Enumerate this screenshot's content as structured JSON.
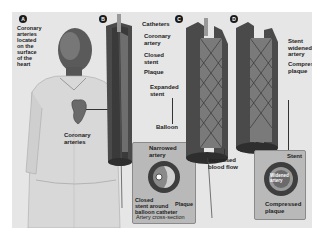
{
  "diagram": {
    "type": "medical-illustration",
    "panels": [
      {
        "id": "A",
        "labels": {
          "intro": "Coronary\narteries\nlocated\non the\nsurface\nof the\nheart",
          "heart": "Coronary\narteries"
        }
      },
      {
        "id": "B",
        "labels": {
          "catheters": "Catheters",
          "coronary_artery": "Coronary\nartery",
          "closed_stent": "Closed\nstent",
          "plaque": "Plaque",
          "expanded_stent": "Expanded\nstent",
          "balloon": "Balloon",
          "narrowed_artery": "Narrowed\nartery",
          "cross_closed_stent": "Closed\nstent around\nballoon catheter",
          "cross_plaque": "Plaque",
          "cross_caption": "Artery cross-section"
        }
      },
      {
        "id": "C",
        "labels": {
          "increased_flow": "Increased\nblood flow"
        }
      },
      {
        "id": "D",
        "labels": {
          "stent_widened": "Stent\nwidened\nartery",
          "compressed_plaque": "Compressed\nplaque",
          "cross_stent": "Stent",
          "cross_widened": "Widened\nartery",
          "cross_compressed": "Compressed\nplaque"
        }
      }
    ]
  }
}
